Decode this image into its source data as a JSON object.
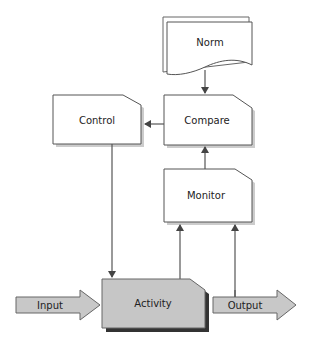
{
  "diagram": {
    "type": "control-loop flowchart",
    "nodes": {
      "norm": {
        "label": "Norm",
        "shape": "multi-document"
      },
      "compare": {
        "label": "Compare",
        "shape": "cut-corner-box"
      },
      "control": {
        "label": "Control",
        "shape": "cut-corner-box"
      },
      "monitor": {
        "label": "Monitor",
        "shape": "cut-corner-box"
      },
      "activity": {
        "label": "Activity",
        "shape": "cut-corner-box-shaded"
      },
      "input": {
        "label": "Input",
        "shape": "block-arrow"
      },
      "output": {
        "label": "Output",
        "shape": "block-arrow"
      }
    },
    "edges": [
      {
        "from": "Norm",
        "to": "Compare"
      },
      {
        "from": "Compare",
        "to": "Control"
      },
      {
        "from": "Control",
        "to": "Activity"
      },
      {
        "from": "Activity",
        "to": "Monitor"
      },
      {
        "from": "Output",
        "to": "Monitor"
      },
      {
        "from": "Monitor",
        "to": "Compare"
      },
      {
        "from": "Input",
        "to": "Activity"
      },
      {
        "from": "Activity",
        "to": "Output"
      }
    ],
    "colors": {
      "box_fill": "#ffffff",
      "box_stroke": "#555555",
      "box_shadow": "#c8c8c8",
      "activity_fill": "#c6c6c6",
      "activity_shadow": "#333333",
      "arrow_fill": "#c8c8c8",
      "line": "#555555"
    }
  }
}
